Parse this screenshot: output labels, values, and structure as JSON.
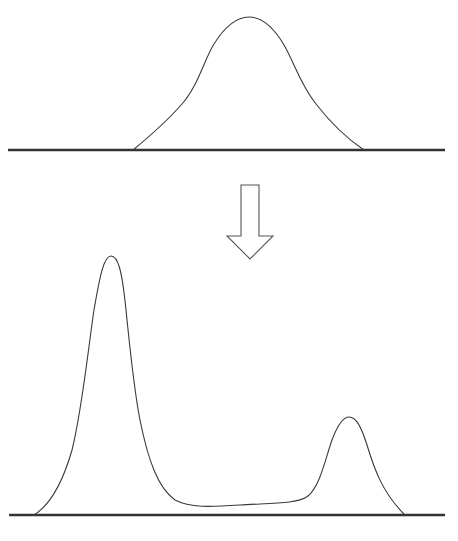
{
  "diagram": {
    "colors": {
      "stroke": "#3a3a3a",
      "baseline": "#333333",
      "background": "#ffffff"
    },
    "top_panel": {
      "label": "unimodal distribution",
      "baseline": {
        "x1": 8,
        "x2": 445,
        "y": 150
      },
      "curve": {
        "start_x": 133,
        "peak_x": 249,
        "peak_y": 17,
        "end_x": 364
      }
    },
    "arrow": {
      "direction": "down",
      "icon": "down-arrow-icon",
      "x": 250,
      "top_y": 185,
      "tip_y": 259
    },
    "bottom_panel": {
      "label": "bimodal distribution",
      "baseline": {
        "x1": 9,
        "x2": 445,
        "y": 515
      },
      "peaks": [
        {
          "name": "major-peak",
          "x": 111,
          "y": 256
        },
        {
          "name": "minor-peak",
          "x": 349,
          "y": 417
        }
      ],
      "curve": {
        "start_x": 34,
        "end_x": 404
      }
    }
  }
}
